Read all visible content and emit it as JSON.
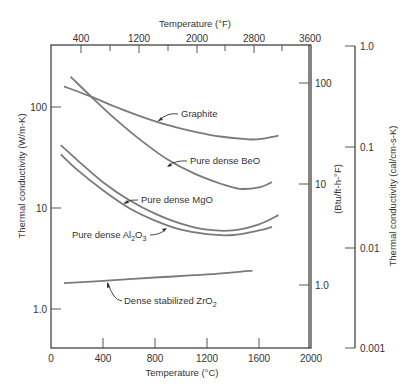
{
  "chart_data": {
    "type": "line",
    "title": "",
    "xlabel": "Temperature (°C)",
    "x2label": "Temperature (°F)",
    "ylabel": "Thermal conductivity (W/m-K)",
    "y2label": "(Btu/ft-h-°F)",
    "y3label": "Thermal conductivity (cal/cm-s-K)",
    "xlim": [
      0,
      2000
    ],
    "ylim": [
      0.3,
      300
    ],
    "yscale": "log",
    "grid": false,
    "x_ticks": [
      "0",
      "400",
      "800",
      "1200",
      "1600",
      "2000"
    ],
    "x_tick_values": [
      0,
      400,
      800,
      1200,
      1600,
      2000
    ],
    "x2_ticks": [
      "400",
      "1200",
      "2000",
      "2800",
      "3600"
    ],
    "x2_tick_values": [
      400,
      1200,
      2000,
      2800,
      3600
    ],
    "y_ticks": [
      "100",
      "10",
      "1.0"
    ],
    "y_tick_values": [
      100,
      10,
      1.0
    ],
    "y2_ticks": [
      "100",
      "10",
      "1.0"
    ],
    "y2_tick_values": [
      100,
      10,
      1.0
    ],
    "y3_ticks": [
      "1.0",
      "0.1",
      "0.01",
      "0.001"
    ],
    "y3_tick_values": [
      1.0,
      0.1,
      0.01,
      0.001
    ],
    "series": [
      {
        "name": "Graphite",
        "label": "Graphite",
        "x": [
          100,
          300,
          500,
          700,
          900,
          1100,
          1300,
          1500,
          1600,
          1750
        ],
        "y": [
          160,
          128,
          100,
          80,
          66,
          57,
          51,
          48,
          48,
          52
        ]
      },
      {
        "name": "Pure dense BeO",
        "label": "Pure dense BeO",
        "x": [
          150,
          300,
          500,
          700,
          900,
          1100,
          1300,
          1450,
          1600,
          1700
        ],
        "y": [
          200,
          130,
          75,
          46,
          30,
          22,
          17.5,
          15.5,
          16,
          18
        ]
      },
      {
        "name": "Pure dense MgO",
        "label": "Pure dense MgO",
        "x": [
          75,
          200,
          400,
          600,
          800,
          1000,
          1200,
          1400,
          1600,
          1750
        ],
        "y": [
          42,
          30,
          18,
          12,
          8.8,
          7.0,
          6.1,
          6.0,
          6.9,
          8.5
        ]
      },
      {
        "name": "Pure dense Al2O3",
        "label_main": "Pure dense Al",
        "label_sub1": "2",
        "label_mid": "O",
        "label_sub2": "3",
        "x": [
          75,
          200,
          400,
          600,
          800,
          1000,
          1200,
          1400,
          1600,
          1700
        ],
        "y": [
          34,
          24,
          15,
          10,
          7.5,
          6.1,
          5.5,
          5.4,
          6.0,
          6.5
        ]
      },
      {
        "name": "Dense stabilized ZrO2",
        "label_main": "Dense stabilized ZrO",
        "label_sub": "2",
        "x": [
          100,
          400,
          800,
          1200,
          1550
        ],
        "y": [
          1.8,
          1.9,
          2.05,
          2.2,
          2.4
        ]
      }
    ]
  }
}
